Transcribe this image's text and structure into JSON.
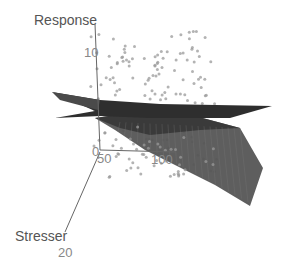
{
  "chart_data": {
    "type": "scatter3d",
    "title": "",
    "axes": {
      "z": {
        "label": "Response",
        "ticks": [
          "0",
          "10"
        ]
      },
      "x": {
        "label": "",
        "ticks": [
          "50",
          "100"
        ]
      },
      "y": {
        "label": "Stresser",
        "ticks": [
          "20"
        ]
      }
    },
    "series": [
      {
        "name": "observations",
        "type": "scatter",
        "color": "#9a9a9a",
        "count_approx": 200
      },
      {
        "name": "surface-1",
        "type": "surface",
        "color": "#3a3a3a",
        "description": "near-flat plane"
      },
      {
        "name": "surface-2",
        "type": "surface",
        "color": "#4a4a4a",
        "description": "sloping wireframe surface descending to the right"
      }
    ],
    "grid": false,
    "legend": null
  },
  "labels": {
    "response": "Response",
    "z_tick_10": "10",
    "z_tick_0": "0",
    "x_tick_50": "50",
    "x_tick_100": "100",
    "stresser": "Stresser",
    "y_tick_20": "20"
  },
  "colors": {
    "background": "#ffffff",
    "axis": "#555555",
    "points": "#9a9a9a",
    "surface_dark": "#2e2e2e",
    "surface_mid": "#5a5a5a"
  }
}
